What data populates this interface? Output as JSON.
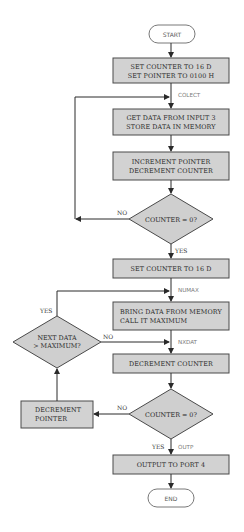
{
  "terminals": {
    "start": "START",
    "end": "END"
  },
  "boxes": {
    "init": {
      "line1": "SET COUNTER TO 16 D",
      "line2": "SET POINTER TO 0100 H"
    },
    "get_data": {
      "line1": "GET DATA FROM INPUT 3",
      "line2": "STORE DATA IN MEMORY"
    },
    "inc_dec": {
      "line1": "INCREMENT POINTER",
      "line2": "DECREMENT COUNTER"
    },
    "set_counter": {
      "line1": "SET COUNTER TO 16 D"
    },
    "bring_data": {
      "line1": "BRING DATA FROM MEMORY",
      "line2": "CALL IT MAXIMUM"
    },
    "dec_counter": {
      "line1": "DECREMENT COUNTER"
    },
    "dec_pointer": {
      "line1": "DECREMENT",
      "line2": "POINTER"
    },
    "output": {
      "line1": "OUTPUT TO PORT 4"
    }
  },
  "decisions": {
    "counter_zero_1": {
      "text": "COUNTER = 0?",
      "no": "NO",
      "yes": "YES"
    },
    "next_data": {
      "line1": "NEXT DATA",
      "line2": "> MAXIMUM?",
      "yes": "YES",
      "no": "NO"
    },
    "counter_zero_2": {
      "text": "COUNTER = 0?",
      "no": "NO",
      "yes": "YES"
    }
  },
  "labels": {
    "colect": "COLECT",
    "numax": "NUMAX",
    "nxdat": "NXDAT",
    "outp": "OUTP"
  },
  "colors": {
    "box_fill": "#d2d2d2",
    "line": "#2a2a2a",
    "label": "#7a7a7a"
  }
}
